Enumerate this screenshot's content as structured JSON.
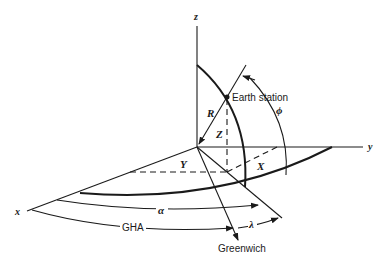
{
  "diagram": {
    "type": "3d-coordinate-geometry",
    "axes": {
      "x": "x",
      "y": "y",
      "z": "z"
    },
    "components": {
      "R": "R",
      "X": "X",
      "Y": "Y",
      "Z": "Z"
    },
    "angles": {
      "phi": "ϕ",
      "alpha": "α",
      "lambda": "λ",
      "gha": "GHA"
    },
    "labels": {
      "earth_station": "Earth station",
      "greenwich": "Greenwich"
    }
  }
}
